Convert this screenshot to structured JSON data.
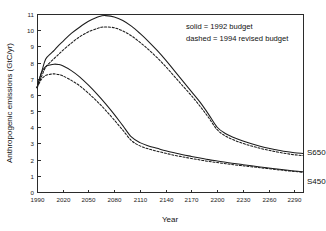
{
  "chart_data": {
    "type": "line",
    "title": "",
    "xlabel": "Year",
    "ylabel": "Anthropogenic emissions (GtC/yr)",
    "xlim": [
      1990,
      2300
    ],
    "ylim": [
      0,
      11
    ],
    "xticks": [
      1990,
      2020,
      2050,
      2080,
      2110,
      2140,
      2170,
      2200,
      2230,
      2260,
      2290
    ],
    "yticks": [
      0,
      1,
      2,
      3,
      4,
      5,
      6,
      7,
      8,
      9,
      10,
      11
    ],
    "grid": false,
    "legend_position": "upper-right-inside",
    "annotations": [
      "solid = 1992 budget",
      "dashed = 1994 revised budget"
    ],
    "series": [
      {
        "name": "S650 1992 budget",
        "style": "solid",
        "label": "S650",
        "x": [
          1990,
          1995,
          2000,
          2005,
          2010,
          2015,
          2020,
          2030,
          2040,
          2050,
          2060,
          2065,
          2070,
          2080,
          2090,
          2100,
          2110,
          2120,
          2130,
          2140,
          2150,
          2160,
          2170,
          2180,
          2190,
          2200,
          2210,
          2220,
          2230,
          2240,
          2250,
          2260,
          2270,
          2280,
          2290,
          2300
        ],
        "y": [
          6.45,
          7.35,
          8.2,
          8.5,
          8.75,
          9.05,
          9.3,
          9.8,
          10.2,
          10.55,
          10.8,
          10.88,
          10.9,
          10.82,
          10.6,
          10.25,
          9.8,
          9.3,
          8.75,
          8.15,
          7.5,
          6.85,
          6.2,
          5.55,
          4.8,
          4.0,
          3.6,
          3.35,
          3.15,
          2.98,
          2.83,
          2.7,
          2.6,
          2.5,
          2.43,
          2.38
        ]
      },
      {
        "name": "S650 1994 revised budget",
        "style": "dashed",
        "label": "S650",
        "x": [
          1990,
          1995,
          2000,
          2005,
          2010,
          2015,
          2020,
          2030,
          2040,
          2050,
          2060,
          2065,
          2070,
          2080,
          2090,
          2100,
          2110,
          2120,
          2130,
          2140,
          2150,
          2160,
          2170,
          2180,
          2190,
          2200,
          2210,
          2220,
          2230,
          2240,
          2250,
          2260,
          2270,
          2280,
          2290,
          2300
        ],
        "y": [
          6.45,
          7.1,
          7.7,
          8.0,
          8.25,
          8.5,
          8.75,
          9.2,
          9.6,
          9.9,
          10.1,
          10.18,
          10.2,
          10.15,
          9.95,
          9.65,
          9.25,
          8.8,
          8.3,
          7.75,
          7.15,
          6.55,
          5.95,
          5.3,
          4.6,
          3.85,
          3.45,
          3.2,
          3.0,
          2.84,
          2.7,
          2.58,
          2.47,
          2.38,
          2.3,
          2.25
        ]
      },
      {
        "name": "S450 1992 budget",
        "style": "solid",
        "label": "S450",
        "x": [
          1990,
          1995,
          2000,
          2005,
          2010,
          2015,
          2020,
          2030,
          2040,
          2050,
          2060,
          2070,
          2080,
          2090,
          2100,
          2110,
          2120,
          2130,
          2140,
          2150,
          2160,
          2170,
          2180,
          2190,
          2200,
          2210,
          2220,
          2230,
          2240,
          2250,
          2260,
          2270,
          2280,
          2290,
          2300
        ],
        "y": [
          6.45,
          7.35,
          7.75,
          7.85,
          7.9,
          7.88,
          7.8,
          7.5,
          7.1,
          6.6,
          6.05,
          5.45,
          4.8,
          4.1,
          3.4,
          3.05,
          2.85,
          2.7,
          2.55,
          2.42,
          2.3,
          2.2,
          2.1,
          2.0,
          1.92,
          1.84,
          1.76,
          1.69,
          1.62,
          1.55,
          1.48,
          1.42,
          1.36,
          1.3,
          1.25
        ]
      },
      {
        "name": "S450 1994 revised budget",
        "style": "dashed",
        "label": "S450",
        "x": [
          1990,
          1995,
          2000,
          2005,
          2010,
          2015,
          2020,
          2030,
          2040,
          2050,
          2060,
          2070,
          2080,
          2090,
          2100,
          2110,
          2120,
          2130,
          2140,
          2150,
          2160,
          2170,
          2180,
          2190,
          2200,
          2210,
          2220,
          2230,
          2240,
          2250,
          2260,
          2270,
          2280,
          2290,
          2300
        ],
        "y": [
          6.45,
          6.95,
          7.2,
          7.27,
          7.3,
          7.26,
          7.18,
          6.9,
          6.55,
          6.1,
          5.6,
          5.05,
          4.45,
          3.82,
          3.18,
          2.85,
          2.66,
          2.52,
          2.39,
          2.27,
          2.17,
          2.07,
          1.98,
          1.89,
          1.82,
          1.75,
          1.68,
          1.62,
          1.56,
          1.5,
          1.44,
          1.38,
          1.32,
          1.27,
          1.22
        ]
      }
    ]
  },
  "plot_geometry": {
    "left": 37,
    "right": 303,
    "top": 14,
    "bottom": 192
  },
  "legend_lines": {
    "line1": "solid = 1992 budget",
    "line2": "dashed = 1994 revised budget"
  },
  "series_labels": {
    "s650": "S650",
    "s450": "S450"
  },
  "axis_titles": {
    "x": "Year",
    "y": "Anthropogenic emissions (GtC/yr)"
  }
}
